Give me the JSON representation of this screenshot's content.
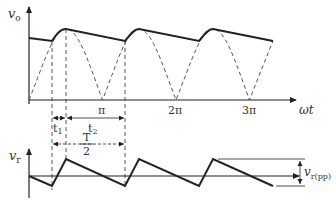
{
  "figure": {
    "top_plot": {
      "y_axis_label": "v",
      "y_axis_sub": "o",
      "x_axis_label": "ωt",
      "x_ticks": [
        "π",
        "2π",
        "3π"
      ],
      "description": "Full-wave rectified sine (dashed) with capacitor-filtered output (solid)"
    },
    "intervals": {
      "t1_label": "t",
      "t1_sub": "1",
      "t2_label": "t",
      "t2_sub": "2",
      "half_period_num": "T",
      "half_period_den": "2"
    },
    "bottom_plot": {
      "y_axis_label": "v",
      "y_axis_sub": "r",
      "ripple_label": "v",
      "ripple_sub": "r(pp)",
      "description": "Ripple voltage sawtooth"
    },
    "colors": {
      "line": "#222222",
      "dashed": "#444444",
      "text": "#333333"
    }
  }
}
